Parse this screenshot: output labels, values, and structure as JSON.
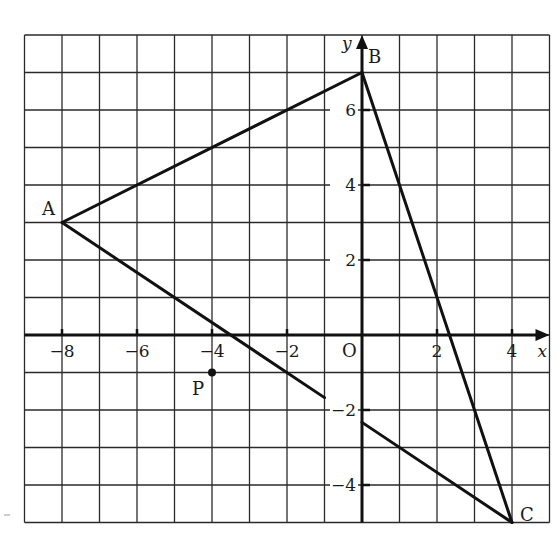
{
  "diagram": {
    "type": "coordinate-plane",
    "grid": {
      "x_range": [
        -9,
        5
      ],
      "y_range": [
        -5,
        8
      ],
      "step": 1
    },
    "axes": {
      "x_label": "x",
      "y_label": "y",
      "origin_label": "O",
      "x_ticks": [
        {
          "value": -8,
          "label": "−8"
        },
        {
          "value": -6,
          "label": "−6"
        },
        {
          "value": -4,
          "label": "−4"
        },
        {
          "value": -2,
          "label": "−2"
        },
        {
          "value": 2,
          "label": "2"
        },
        {
          "value": 4,
          "label": "4"
        }
      ],
      "y_ticks": [
        {
          "value": 6,
          "label": "6"
        },
        {
          "value": 4,
          "label": "4"
        },
        {
          "value": 2,
          "label": "2"
        },
        {
          "value": -2,
          "label": "−2"
        },
        {
          "value": -4,
          "label": "−4"
        }
      ]
    },
    "points": [
      {
        "name": "A",
        "x": -8,
        "y": 3
      },
      {
        "name": "B",
        "x": 0,
        "y": 7
      },
      {
        "name": "C",
        "x": 4,
        "y": -5
      },
      {
        "name": "P",
        "x": -4,
        "y": -1
      }
    ],
    "segments": [
      {
        "from": [
          -8,
          3
        ],
        "to": [
          0,
          7
        ],
        "label": "AB"
      },
      {
        "from": [
          0,
          7
        ],
        "to": [
          4,
          -5
        ],
        "label": "BC"
      },
      {
        "from": [
          -8,
          3
        ],
        "to": [
          -1,
          -1.67
        ],
        "label": "ray from A"
      },
      {
        "from": [
          4,
          -5
        ],
        "to": [
          0,
          -2.33
        ],
        "label": "ray from C"
      }
    ]
  }
}
